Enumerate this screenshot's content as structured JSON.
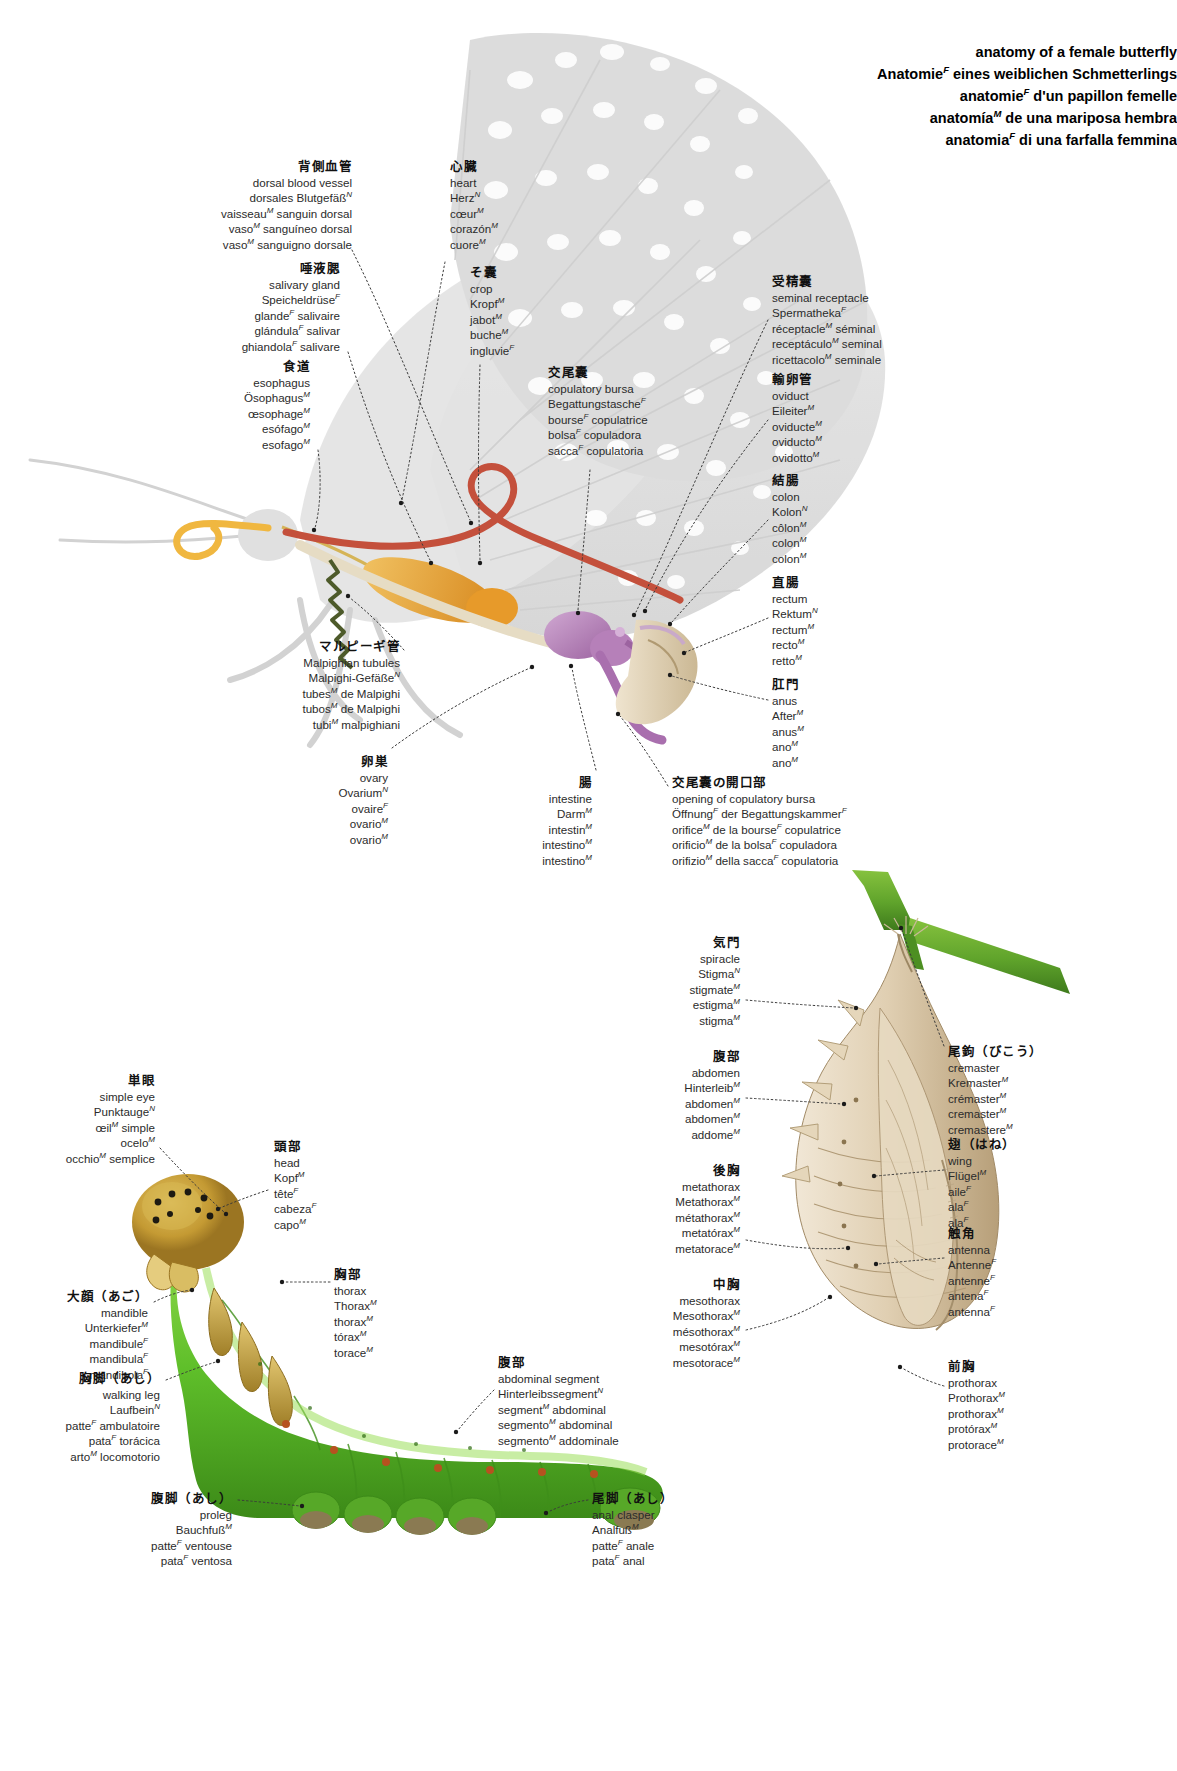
{
  "page": {
    "title_lines": [
      "anatomy of a female butterfly",
      "Anatomieᶠ eines weiblichen Schmetterlings",
      "anatomieᶠ d'un papillon femelle",
      "anatomíaᴹ de una mariposa hembra",
      "anatomiaᶠ di una farfalla femmina"
    ]
  },
  "butterfly_labels": [
    {
      "id": "dorsal-blood-vessel",
      "ja": "背側血管",
      "lines": [
        "dorsal blood vessel",
        "dorsales Blutgefäßᴺ",
        "vaisseauᴹ sanguin dorsal",
        "vasoᴹ sanguíneo dorsal",
        "vasoᴹ sanguigno dorsale"
      ],
      "align": "right",
      "x": 352,
      "y": 160
    },
    {
      "id": "heart",
      "ja": "心臓",
      "lines": [
        "heart",
        "Herzᴺ",
        "cœurᴹ",
        "corazónᴹ",
        "cuoreᴹ"
      ],
      "align": "left",
      "x": 450,
      "y": 160
    },
    {
      "id": "salivary-gland",
      "ja": "唾液腮",
      "lines": [
        "salivary gland",
        "Speicheldrüseᶠ",
        "glandeᶠ salivaire",
        "glándulaᶠ salivar",
        "ghiandolaᶠ salivare"
      ],
      "align": "right",
      "x": 340,
      "y": 262
    },
    {
      "id": "crop",
      "ja": "そ囊",
      "lines": [
        "crop",
        "Kropfᴹ",
        "jabotᴹ",
        "bucheᴹ",
        "ingluvieᶠ"
      ],
      "align": "left",
      "x": 470,
      "y": 266
    },
    {
      "id": "esophagus",
      "ja": "食道",
      "lines": [
        "esophagus",
        "Ösophagusᴹ",
        "œsophageᴹ",
        "esófagoᴹ",
        "esofagoᴹ"
      ],
      "align": "right",
      "x": 310,
      "y": 360
    },
    {
      "id": "copulatory-bursa",
      "ja": "交尾囊",
      "lines": [
        "copulatory bursa",
        "Begattungstascheᶠ",
        "bourseᶠ copulatrice",
        "bolsaᶠ copuladora",
        "saccaᶠ copulatoria"
      ],
      "align": "left",
      "x": 548,
      "y": 366
    },
    {
      "id": "seminal-receptacle",
      "ja": "受精囊",
      "lines": [
        "seminal receptacle",
        "Spermathekaᶠ",
        "réceptacleᴹ séminal",
        "receptáculoᴹ seminal",
        "ricettacoloᴹ seminale"
      ],
      "align": "left",
      "x": 772,
      "y": 275
    },
    {
      "id": "oviduct",
      "ja": "輸卵管",
      "lines": [
        "oviduct",
        "Eileiterᴹ",
        "oviducteᴹ",
        "oviductoᴹ",
        "ovidottoᴹ"
      ],
      "align": "left",
      "x": 772,
      "y": 373
    },
    {
      "id": "colon",
      "ja": "結腸",
      "lines": [
        "colon",
        "Kolonᴺ",
        "côlonᴹ",
        "colonᴹ",
        "colonᴹ"
      ],
      "align": "left",
      "x": 772,
      "y": 474
    },
    {
      "id": "rectum",
      "ja": "直腸",
      "lines": [
        "rectum",
        "Rektumᴺ",
        "rectumᴹ",
        "rectoᴹ",
        "rettoᴹ"
      ],
      "align": "left",
      "x": 772,
      "y": 576
    },
    {
      "id": "anus",
      "ja": "肛門",
      "lines": [
        "anus",
        "Afterᴹ",
        "anusᴹ",
        "anoᴹ",
        "anoᴹ"
      ],
      "align": "left",
      "x": 772,
      "y": 678
    },
    {
      "id": "malpighian-tubules",
      "ja": "マルピーギ管",
      "lines": [
        "Malpighian tubules",
        "Malpighi-Gefäßeᴺ",
        "tubesᴹ de Malpighi",
        "tubosᴹ de Malpighi",
        "tubiᴹ malpighiani"
      ],
      "align": "right",
      "x": 400,
      "y": 640
    },
    {
      "id": "ovary",
      "ja": "卵巣",
      "lines": [
        "ovary",
        "Ovariumᴺ",
        "ovaireᶠ",
        "ovarioᴹ",
        "ovarioᴹ"
      ],
      "align": "right",
      "x": 388,
      "y": 755
    },
    {
      "id": "intestine",
      "ja": "腸",
      "lines": [
        "intestine",
        "Darmᴹ",
        "intestinᴹ",
        "intestinoᴹ",
        "intestinoᴹ"
      ],
      "align": "right",
      "x": 592,
      "y": 776
    },
    {
      "id": "opening-of-copulatory-bursa",
      "ja": "交尾囊の開口部",
      "lines": [
        "opening of copulatory bursa",
        "Öffnungᶠ der Begattungskammerᶠ",
        "orificeᴹ de la bourseᶠ copulatrice",
        "orificioᴹ de la bolsaᶠ copuladora",
        "orifizioᴹ della saccaᶠ copulatoria"
      ],
      "align": "left",
      "x": 672,
      "y": 776
    }
  ],
  "chrysalis_labels": [
    {
      "id": "spiracle",
      "ja": "気門",
      "lines": [
        "spiracle",
        "Stigmaᴺ",
        "stigmateᴹ",
        "estigmaᴹ",
        "stigmaᴹ"
      ],
      "align": "right",
      "x": 740,
      "y": 936
    },
    {
      "id": "abdomen",
      "ja": "腹部",
      "lines": [
        "abdomen",
        "Hinterleibᴹ",
        "abdomenᴹ",
        "abdomenᴹ",
        "addomeᴹ"
      ],
      "align": "right",
      "x": 740,
      "y": 1050
    },
    {
      "id": "metathorax",
      "ja": "後胸",
      "lines": [
        "metathorax",
        "Metathoraxᴹ",
        "métathoraxᴹ",
        "metatóraxᴹ",
        "metatoraceᴹ"
      ],
      "align": "right",
      "x": 740,
      "y": 1164
    },
    {
      "id": "mesothorax",
      "ja": "中胸",
      "lines": [
        "mesothorax",
        "Mesothoraxᴹ",
        "mésothoraxᴹ",
        "mesotóraxᴹ",
        "mesotoraceᴹ"
      ],
      "align": "right",
      "x": 740,
      "y": 1278
    },
    {
      "id": "cremaster",
      "ja": "尾鉤（びこう）",
      "lines": [
        "cremaster",
        "Kremasterᴹ",
        "crémasterᴹ",
        "cremasterᴹ",
        "cremastereᴹ"
      ],
      "align": "left",
      "x": 948,
      "y": 1045
    },
    {
      "id": "wing",
      "ja": "翅（はね）",
      "lines": [
        "wing",
        "Flügelᴹ",
        "aileᶠ",
        "alaᶠ",
        "alaᶠ"
      ],
      "align": "left",
      "x": 948,
      "y": 1138
    },
    {
      "id": "antenna",
      "ja": "触角",
      "lines": [
        "antenna",
        "Antenneᶠ",
        "antenneᶠ",
        "antenaᶠ",
        "antennaᶠ"
      ],
      "align": "left",
      "x": 948,
      "y": 1227
    },
    {
      "id": "prothorax",
      "ja": "前胸",
      "lines": [
        "prothorax",
        "Prothoraxᴹ",
        "prothoraxᴹ",
        "protóraxᴹ",
        "protoraceᴹ"
      ],
      "align": "left",
      "x": 948,
      "y": 1360
    }
  ],
  "caterpillar_labels": [
    {
      "id": "simple-eye",
      "ja": "単眼",
      "lines": [
        "simple eye",
        "Punktaugeᴺ",
        "œilᴹ simple",
        "oceloᴹ",
        "occhioᴹ semplice"
      ],
      "align": "right",
      "x": 155,
      "y": 1074
    },
    {
      "id": "head",
      "ja": "頭部",
      "lines": [
        "head",
        "Kopfᴹ",
        "têteᶠ",
        "cabezaᶠ",
        "capoᴹ"
      ],
      "align": "left",
      "x": 274,
      "y": 1140
    },
    {
      "id": "thorax",
      "ja": "胸部",
      "lines": [
        "thorax",
        "Thoraxᴹ",
        "thoraxᴹ",
        "tóraxᴹ",
        "toraceᴹ"
      ],
      "align": "left",
      "x": 334,
      "y": 1268
    },
    {
      "id": "mandible",
      "ja": "大顔（あご）",
      "lines": [
        "mandible",
        "Unterkieferᴹ",
        "mandibuleᶠ",
        "mandibulaᶠ",
        "mandibolaᶠ"
      ],
      "align": "right",
      "x": 148,
      "y": 1290
    },
    {
      "id": "walking-leg",
      "ja": "胸脚（あし）",
      "lines": [
        "walking leg",
        "Laufbeinᴺ",
        "patteᶠ ambulatoire",
        "pataᶠ torácica",
        "artoᴹ locomotorio"
      ],
      "align": "right",
      "x": 160,
      "y": 1372
    },
    {
      "id": "abdominal-segment",
      "ja": "腹部",
      "lines": [
        "abdominal segment",
        "Hinterleibssegmentᴺ",
        "segmentᴹ abdominal",
        "segmentoᴹ abdominal",
        "segmentoᴹ addominale"
      ],
      "align": "left",
      "x": 498,
      "y": 1356
    },
    {
      "id": "proleg",
      "ja": "腹脚（あし）",
      "lines": [
        "proleg",
        "Bauchfußᴹ",
        "patteᶠ ventouse",
        "pataᶠ ventosa"
      ],
      "align": "right",
      "x": 232,
      "y": 1492
    },
    {
      "id": "anal-clasper",
      "ja": "尾脚（あし）",
      "lines": [
        "anal clasper",
        "Analfußᴹ",
        "patteᶠ anale",
        "pataᶠ anal"
      ],
      "align": "left",
      "x": 592,
      "y": 1492
    }
  ],
  "colors": {
    "wing_ghost": "#d9d9d9",
    "crop_orange": "#e8a33a",
    "gut_red": "#c8503c",
    "bursa_purple": "#b27ab5",
    "twig_green": "#5fa32b",
    "caterpillar_green": "#62b32e",
    "chrysalis_tan": "#cfb89a",
    "leader": "#3a3a3a"
  }
}
